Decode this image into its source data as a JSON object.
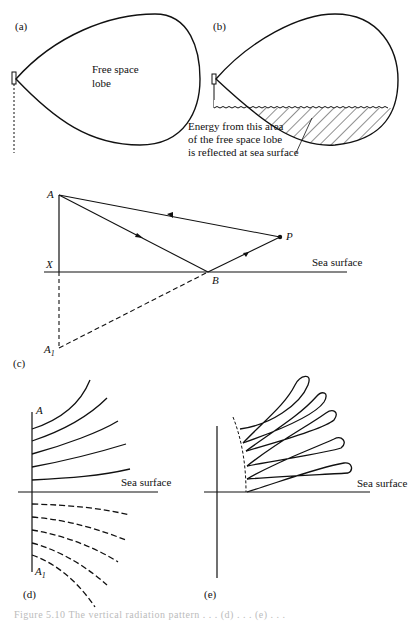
{
  "figure": {
    "panels": {
      "a": {
        "label": "(a)",
        "lobe_text_1": "Free space",
        "lobe_text_2": "lobe"
      },
      "b": {
        "label": "(b)",
        "annotation_1": "Energy from this area",
        "annotation_2": "of the free space lobe",
        "annotation_3": "is reflected at sea surface"
      },
      "c": {
        "label": "(c)",
        "point_A": "A",
        "point_X": "X",
        "point_B": "B",
        "point_P": "P",
        "point_A1": "A",
        "point_A1_sub": "1",
        "sea_surface": "Sea surface"
      },
      "d": {
        "label": "(d)",
        "point_A": "A",
        "point_A1": "A",
        "point_A1_sub": "1",
        "sea_surface": "Sea surface"
      },
      "e": {
        "label": "(e)",
        "sea_surface": "Sea surface"
      }
    },
    "caption": "Figure 5.10   The vertical radiation pattern . . . (d) . . . (e) . . ."
  }
}
